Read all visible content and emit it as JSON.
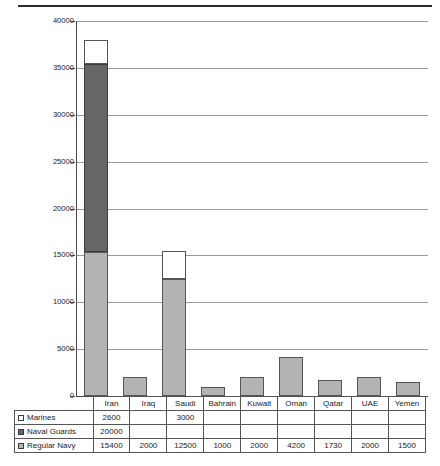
{
  "chart_data": {
    "type": "bar",
    "subtype": "stacked-column",
    "title": "",
    "xlabel": "",
    "ylabel": "",
    "ylim": [
      0,
      40000
    ],
    "ytick_interval": 5000,
    "yticks": [
      "40000",
      "35000",
      "30000",
      "25000",
      "20000",
      "15000",
      "10000",
      "5000",
      "0"
    ],
    "grid": true,
    "legend_position": "table-row-headers",
    "categories": [
      "Iran",
      "Iraq",
      "Saudi",
      "Bahrain",
      "Kuwait",
      "Oman",
      "Qatar",
      "UAE",
      "Yemen"
    ],
    "series": [
      {
        "name": "Marines",
        "color": "#ffffff",
        "swatch": "marines-swatch",
        "values": [
          2600,
          null,
          3000,
          null,
          null,
          null,
          null,
          null,
          null
        ],
        "labels": [
          "2600",
          "",
          "3000",
          "",
          "",
          "",
          "",
          "",
          ""
        ]
      },
      {
        "name": "Naval Guards",
        "color": "#666666",
        "swatch": "naval-guards-swatch",
        "values": [
          20000,
          null,
          null,
          null,
          null,
          null,
          null,
          null,
          null
        ],
        "labels": [
          "20000",
          "",
          "",
          "",
          "",
          "",
          "",
          "",
          ""
        ]
      },
      {
        "name": "Regular Navy",
        "color": "#b3b3b3",
        "swatch": "regular-navy-swatch",
        "values": [
          15400,
          2000,
          12500,
          1000,
          2000,
          4200,
          1730,
          2000,
          1500
        ],
        "labels": [
          "15400",
          "2000",
          "12500",
          "1000",
          "2000",
          "4200",
          "1730",
          "2000",
          "1500"
        ]
      }
    ]
  },
  "table": {
    "corner_label": "",
    "column_headers": [
      "Iran",
      "Iraq",
      "Saudi",
      "Bahrain",
      "Kuwait",
      "Oman",
      "Qatar",
      "UAE",
      "Yemen"
    ],
    "rows": [
      {
        "label": "Marines",
        "cells": [
          "2600",
          "",
          "3000",
          "",
          "",
          "",
          "",
          "",
          ""
        ]
      },
      {
        "label": "Naval Guards",
        "cells": [
          "20000",
          "",
          "",
          "",
          "",
          "",
          "",
          "",
          ""
        ]
      },
      {
        "label": "Regular Navy",
        "cells": [
          "15400",
          "2000",
          "12500",
          "1000",
          "2000",
          "4200",
          "1730",
          "2000",
          "1500"
        ]
      }
    ]
  },
  "footer": {
    "text": ""
  },
  "colors": {
    "marines": "#ffffff",
    "naval_guards": "#666666",
    "regular_navy": "#b3b3b3",
    "gridline": "#9a9a9a",
    "axis": "#4a4a4a",
    "border": "#555555"
  }
}
